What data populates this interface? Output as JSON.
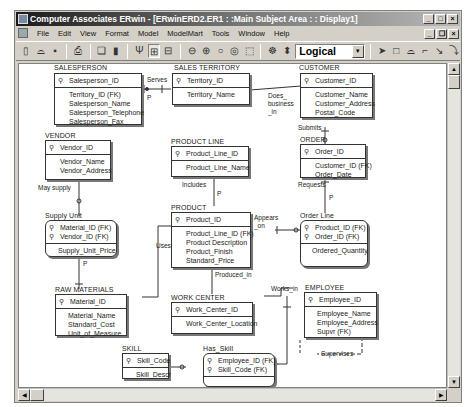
{
  "window": {
    "title": "Computer Associates ERwin - [ERwinERD2.ER1 : :Main Subject Area : : Display1]",
    "controls": {
      "minimize": "_",
      "maximize": "□",
      "close": "×",
      "restore": "❐"
    }
  },
  "menu": {
    "items": [
      "File",
      "Edit",
      "View",
      "Format",
      "Model",
      "ModelMart",
      "Tools",
      "Window",
      "Help"
    ]
  },
  "toolbar": {
    "buttons": [
      "new-icon",
      "open-icon",
      "save-icon",
      "print-icon",
      "report-icon",
      "model-icon",
      "entity-display-icon",
      "attribute-display-icon",
      "definition-icon",
      "zoom-out-icon",
      "zoom-in-icon",
      "zoom-fit-icon",
      "zoom-icon",
      "zoom-area-icon",
      "subject-area-icon",
      "stored-display-icon"
    ],
    "view_mode": "Logical",
    "palette": [
      "pointer-icon",
      "entity-tool-icon",
      "subtype-tool-icon",
      "identifying-rel-icon",
      "many-to-many-rel-icon",
      "non-identifying-rel-icon"
    ]
  },
  "entities": [
    {
      "id": "salesperson",
      "name": "SALESPERSON",
      "pk": [
        "Salesperson_ID"
      ],
      "attrs": [
        "Territory_ID (FK)",
        "Salesperson_Name",
        "Salesperson_Telephone",
        "Salesperson_Fax"
      ],
      "dependent": false
    },
    {
      "id": "sales_territory",
      "name": "SALES TERRITORY",
      "pk": [
        "Territory_ID"
      ],
      "attrs": [
        "Territory_Name"
      ],
      "dependent": false
    },
    {
      "id": "customer",
      "name": "CUSTOMER",
      "pk": [
        "Customer_ID"
      ],
      "attrs": [
        "Customer_Name",
        "Customer_Address",
        "Postal_Code"
      ],
      "dependent": false
    },
    {
      "id": "vendor",
      "name": "VENDOR",
      "pk": [
        "Vendor_ID"
      ],
      "attrs": [
        "Vendor_Name",
        "Vendor_Address"
      ],
      "dependent": false
    },
    {
      "id": "product_line",
      "name": "PRODUCT LINE",
      "pk": [
        "Product_Line_ID"
      ],
      "attrs": [
        "Product_Line_Name"
      ],
      "dependent": false
    },
    {
      "id": "order",
      "name": "ORDER",
      "pk": [
        "Order_ID"
      ],
      "attrs": [
        "Customer_ID (FK)",
        "Order_Date"
      ],
      "dependent": false
    },
    {
      "id": "supply_unit",
      "name": "Supply Unit",
      "pk": [
        "Material_ID (FK)",
        "Vendor_ID (FK)"
      ],
      "attrs": [
        "Supply_Unit_Price"
      ],
      "dependent": true
    },
    {
      "id": "product",
      "name": "PRODUCT",
      "pk": [
        "Product_ID"
      ],
      "attrs": [
        "Product_Line_ID (FK)",
        "Product Description",
        "Product_Finish",
        "Standard_Price"
      ],
      "dependent": false
    },
    {
      "id": "order_line",
      "name": "Order Line",
      "pk": [
        "Product_ID (FK)",
        "Order_ID (FK)"
      ],
      "attrs": [
        "Ordered_Quantity"
      ],
      "dependent": true
    },
    {
      "id": "raw_materials",
      "name": "RAW MATERIALS",
      "pk": [
        "Material_ID"
      ],
      "attrs": [
        "Material_Name",
        "Standard_Cost",
        "Unit_of_Measure"
      ],
      "dependent": false
    },
    {
      "id": "work_center",
      "name": "WORK CENTER",
      "pk": [
        "Work_Center_ID"
      ],
      "attrs": [
        "Work_Center_Location"
      ],
      "dependent": false
    },
    {
      "id": "employee",
      "name": "EMPLOYEE",
      "pk": [
        "Employee_ID"
      ],
      "attrs": [
        "Employee_Name",
        "Employee_Address",
        "Supvr (FK)"
      ],
      "dependent": false
    },
    {
      "id": "skill",
      "name": "SKILL",
      "pk": [
        "Skill_Code"
      ],
      "attrs": [
        "Skill_Descr"
      ],
      "dependent": false
    },
    {
      "id": "has_skill",
      "name": "Has_Skill",
      "pk": [
        "Employee_ID (FK)",
        "Skill_Code (FK)"
      ],
      "attrs": [],
      "dependent": true
    }
  ],
  "relationships": [
    {
      "from": "sales_territory",
      "to": "salesperson",
      "label": "Serves",
      "cardinality": "P"
    },
    {
      "from": "sales_territory",
      "to": "customer",
      "label": "Does_ business _in"
    },
    {
      "from": "customer",
      "to": "order",
      "label": "Submits"
    },
    {
      "from": "vendor",
      "to": "supply_unit",
      "label": "May supply"
    },
    {
      "from": "product_line",
      "to": "product",
      "label": "Includes",
      "cardinality": "P"
    },
    {
      "from": "order",
      "to": "order_line",
      "label": "Requests",
      "cardinality": "P"
    },
    {
      "from": "product",
      "to": "order_line",
      "label": "Appears _on"
    },
    {
      "from": "raw_materials",
      "to": "supply_unit",
      "label": "",
      "cardinality": "P"
    },
    {
      "from": "raw_materials",
      "to": "product",
      "label": "Uses"
    },
    {
      "from": "work_center",
      "to": "product",
      "label": "Produced_in"
    },
    {
      "from": "work_center",
      "to": "employee",
      "label": "Works_in"
    },
    {
      "from": "employee",
      "to": "employee",
      "label": "Supervises"
    },
    {
      "from": "employee",
      "to": "has_skill",
      "label": "Has_Skill"
    },
    {
      "from": "skill",
      "to": "has_skill",
      "label": ""
    }
  ],
  "glyphs": {
    "key": "⚲",
    "p": "P"
  }
}
